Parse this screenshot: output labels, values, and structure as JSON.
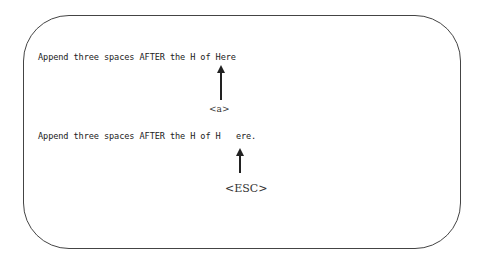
{
  "example": {
    "before_text": "Append three spaces AFTER the H of Here",
    "command_key": "<a>",
    "after_text": "Append three spaces AFTER the H of H   ere.",
    "exit_key": "<ESC>"
  },
  "colors": {
    "border": "#444444",
    "text": "#222222"
  }
}
